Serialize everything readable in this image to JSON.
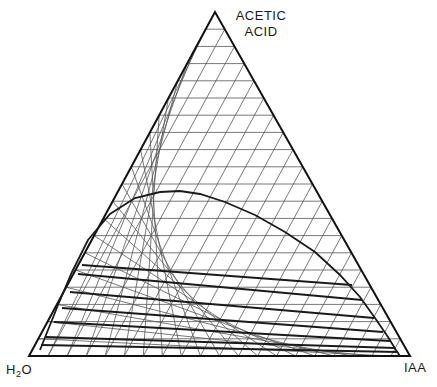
{
  "diagram": {
    "type": "ternary-phase-diagram",
    "vertices": {
      "top": {
        "label_line1": "ACETIC",
        "label_line2": "ACID",
        "x": 215,
        "y": 12
      },
      "left": {
        "label_main": "H",
        "label_sub": "2",
        "label_tail": "O",
        "x": 29,
        "y": 356
      },
      "right": {
        "label": "IAA",
        "x": 410,
        "y": 356
      }
    },
    "grid_divisions": 20,
    "colors": {
      "grid": "#555555",
      "boundary": "#111111",
      "curve": "#1a1a1a",
      "tielines": "#1a1a1a"
    },
    "binodal_curve": [
      [
        40,
        350
      ],
      [
        48,
        330
      ],
      [
        58,
        305
      ],
      [
        72,
        272
      ],
      [
        88,
        240
      ],
      [
        110,
        214
      ],
      [
        135,
        198
      ],
      [
        160,
        192
      ],
      [
        180,
        191
      ],
      [
        200,
        194
      ],
      [
        225,
        202
      ],
      [
        255,
        215
      ],
      [
        285,
        232
      ],
      [
        315,
        252
      ],
      [
        340,
        275
      ],
      [
        360,
        297
      ],
      [
        375,
        318
      ],
      [
        388,
        337
      ],
      [
        396,
        350
      ],
      [
        400,
        356
      ]
    ],
    "tie_lines": [
      {
        "x1": 82,
        "y1": 265,
        "x2": 352,
        "y2": 285
      },
      {
        "x1": 78,
        "y1": 274,
        "x2": 362,
        "y2": 300
      },
      {
        "x1": 70,
        "y1": 292,
        "x2": 374,
        "y2": 318
      },
      {
        "x1": 62,
        "y1": 308,
        "x2": 383,
        "y2": 332
      },
      {
        "x1": 54,
        "y1": 322,
        "x2": 390,
        "y2": 341
      },
      {
        "x1": 46,
        "y1": 337,
        "x2": 395,
        "y2": 348
      },
      {
        "x1": 41,
        "y1": 345,
        "x2": 398,
        "y2": 352
      }
    ]
  }
}
